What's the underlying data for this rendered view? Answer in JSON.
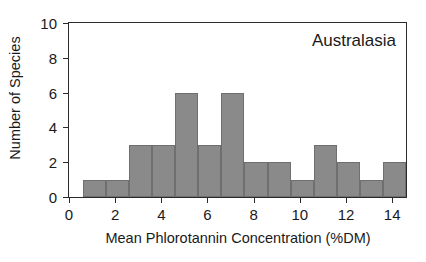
{
  "chart_data": {
    "type": "bar",
    "subtype": "histogram",
    "title": "",
    "annotation": "Australasia",
    "xlabel": "Mean Phlorotannin Concentration (%DM)",
    "ylabel": "Number of Species",
    "xlim": [
      0,
      14.6
    ],
    "ylim": [
      0,
      10
    ],
    "grid": false,
    "legend": null,
    "bin_width": 1,
    "bin_start": 0.6,
    "bin_edges": [
      0.6,
      1.6,
      2.6,
      3.6,
      4.6,
      5.6,
      6.6,
      7.6,
      8.6,
      9.6,
      10.6,
      11.6,
      12.6,
      13.6,
      14.6
    ],
    "categories": [
      "0.6-1.6",
      "1.6-2.6",
      "2.6-3.6",
      "3.6-4.6",
      "4.6-5.6",
      "5.6-6.6",
      "6.6-7.6",
      "7.6-8.6",
      "8.6-9.6",
      "9.6-10.6",
      "10.6-11.6",
      "11.6-12.6",
      "12.6-13.6",
      "13.6-14.6"
    ],
    "values": [
      1,
      1,
      3,
      3,
      6,
      3,
      6,
      2,
      2,
      1,
      3,
      2,
      1,
      2
    ],
    "xticks": [
      0,
      2,
      4,
      6,
      8,
      10,
      12,
      14
    ],
    "xtick_labels": [
      "0",
      "2",
      "4",
      "6",
      "8",
      "10",
      "12",
      "14"
    ],
    "yticks": [
      0,
      2,
      4,
      6,
      8,
      10
    ],
    "ytick_labels": [
      "0",
      "2",
      "4",
      "6",
      "8",
      "10"
    ],
    "bar_color": "#8a8a8a",
    "bar_edge_color": "#6f6f6f",
    "axis_color": "#2b2b2b",
    "background_color": "#ffffff",
    "total_species": 36
  }
}
